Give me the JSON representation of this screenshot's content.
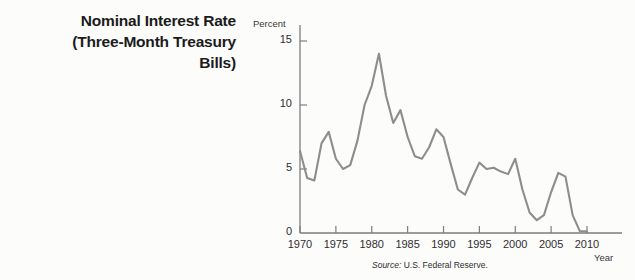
{
  "title": {
    "line1": "Nominal Interest Rate",
    "line2": "(Three-Month Treasury",
    "line3": "Bills)"
  },
  "source": {
    "label": "Source:",
    "text": " U.S. Federal Reserve."
  },
  "colors": {
    "line": "#8d8d8d",
    "axis": "#7d7d7d",
    "text": "#1b1b1b",
    "background": "#fcfcfb"
  },
  "chart_data": {
    "type": "line",
    "title": "Nominal Interest Rate (Three-Month Treasury Bills)",
    "xlabel": "Year",
    "ylabel": "Percent",
    "xlim": [
      1970,
      2011
    ],
    "ylim": [
      0,
      16
    ],
    "yticks": [
      0,
      5,
      10,
      15
    ],
    "ytick_labels": [
      "0",
      "5",
      "10",
      "15"
    ],
    "xticks": [
      1970,
      1975,
      1980,
      1985,
      1990,
      1995,
      2000,
      2005,
      2010
    ],
    "xtick_labels": [
      "1970",
      "1975",
      "1980",
      "1985",
      "1990",
      "1995",
      "2000",
      "2005",
      "2010"
    ],
    "grid": false,
    "legend": null,
    "series": [
      {
        "name": "Three-Month Treasury Bill Rate",
        "x": [
          1970,
          1971,
          1972,
          1973,
          1974,
          1975,
          1976,
          1977,
          1978,
          1979,
          1980,
          1981,
          1982,
          1983,
          1984,
          1985,
          1986,
          1987,
          1988,
          1989,
          1990,
          1991,
          1992,
          1993,
          1994,
          1995,
          1996,
          1997,
          1998,
          1999,
          2000,
          2001,
          2002,
          2003,
          2004,
          2005,
          2006,
          2007,
          2008,
          2009,
          2010
        ],
        "values": [
          6.4,
          4.3,
          4.1,
          7.0,
          7.9,
          5.8,
          5.0,
          5.3,
          7.2,
          10.0,
          11.5,
          14.0,
          10.7,
          8.6,
          9.6,
          7.5,
          6.0,
          5.8,
          6.7,
          8.1,
          7.5,
          5.4,
          3.4,
          3.0,
          4.3,
          5.5,
          5.0,
          5.1,
          4.8,
          4.6,
          5.8,
          3.4,
          1.6,
          1.0,
          1.4,
          3.2,
          4.7,
          4.4,
          1.4,
          0.15,
          0.14
        ]
      }
    ]
  }
}
